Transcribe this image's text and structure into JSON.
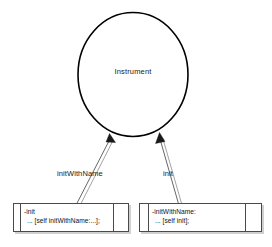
{
  "diagram": {
    "class_node": {
      "name": "Instrument",
      "shape": "circle"
    },
    "edges": [
      {
        "id": "edge-initwithname",
        "label": "initWithName",
        "from": "method-box-left",
        "to": "class-node"
      },
      {
        "id": "edge-init",
        "label": "init",
        "from": "method-box-right",
        "to": "class-node"
      }
    ],
    "method_boxes": [
      {
        "id": "method-box-left",
        "signature": "-init",
        "body": "... [self initWithName:...];"
      },
      {
        "id": "method-box-right",
        "signature": "-initWithName:",
        "body": "... [self init];"
      }
    ]
  },
  "colors": {
    "background": "#ffffff",
    "node_stroke": "#000000",
    "box_stroke": "#4a4a4a",
    "edge_stroke": "#555555",
    "text": "#111111"
  }
}
